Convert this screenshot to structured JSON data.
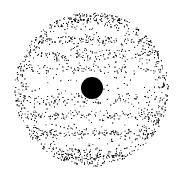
{
  "illustration": {
    "subject": "stippled banded planet with dark spot",
    "background": "#ffffff",
    "ink": "#000000",
    "planet": {
      "cx": 91,
      "cy": 89,
      "r": 77
    },
    "spot": {
      "cx": 92,
      "cy": 88,
      "r": 11
    },
    "bands": [
      {
        "y": 20,
        "h": 10,
        "density": 0.55
      },
      {
        "y": 40,
        "h": 6,
        "density": 0.6
      },
      {
        "y": 55,
        "h": 7,
        "density": 0.55
      },
      {
        "y": 68,
        "h": 5,
        "density": 0.4
      },
      {
        "y": 100,
        "h": 6,
        "density": 0.45
      },
      {
        "y": 115,
        "h": 6,
        "density": 0.55
      },
      {
        "y": 133,
        "h": 7,
        "density": 0.6
      },
      {
        "y": 155,
        "h": 10,
        "density": 0.55
      }
    ]
  }
}
